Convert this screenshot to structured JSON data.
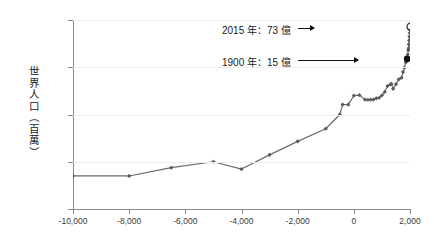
{
  "chart_data": {
    "type": "line",
    "title": "",
    "xlabel": "",
    "ylabel": "世界人口（百萬）",
    "xlim": [
      -10000,
      2000
    ],
    "ylim": [
      1,
      10000
    ],
    "yscale": "log",
    "xscale": "linear",
    "grid": true,
    "legend": null,
    "x_ticks": [
      -10000,
      -8000,
      -6000,
      -4000,
      -2000,
      0,
      2000
    ],
    "x_tick_labels": [
      "-10,000",
      "-8,000",
      "-6,000",
      "-4,000",
      "-2,000",
      "0",
      "2,000"
    ],
    "y_ticks": [
      1,
      10,
      100,
      1000,
      10000
    ],
    "y_tick_labels": [
      "1",
      "10",
      "100",
      "1,000",
      "10,000"
    ],
    "series_name": "World population (millions)",
    "x": [
      -10000,
      -8000,
      -6500,
      -5000,
      -4000,
      -3000,
      -2000,
      -1000,
      -500,
      -400,
      -200,
      0,
      200,
      400,
      500,
      600,
      700,
      800,
      900,
      1000,
      1100,
      1200,
      1300,
      1340,
      1400,
      1500,
      1600,
      1700,
      1750,
      1800,
      1850,
      1900,
      1920,
      1940,
      1950,
      1960,
      1970,
      1980,
      1990,
      2000,
      2010,
      2015
    ],
    "y": [
      5,
      5,
      7.5,
      10,
      7,
      14,
      27,
      50,
      100,
      162,
      162,
      250,
      257,
      206,
      205,
      206,
      207,
      220,
      226,
      254,
      301,
      400,
      432,
      443,
      350,
      438,
      556,
      603,
      791,
      978,
      1262,
      1500,
      1860,
      2300,
      2536,
      3035,
      3700,
      4458,
      5330,
      6145,
      6930,
      7300
    ],
    "annotations": [
      {
        "name": "annot-2015",
        "label": "2015 年：73 億",
        "x": 2015,
        "y": 7300,
        "marker": "hollow"
      },
      {
        "name": "annot-1900",
        "label": "1900 年：15 億",
        "x": 1900,
        "y": 1500,
        "marker": "filled"
      }
    ],
    "colors": {
      "line": "#6b6b6b",
      "marker": "#5a5a5a",
      "grid": "#ededed",
      "axis": "#8a8a8a",
      "text": "#3b3b3b",
      "annotation": "#1a1a1a",
      "background": "#ffffff"
    }
  }
}
